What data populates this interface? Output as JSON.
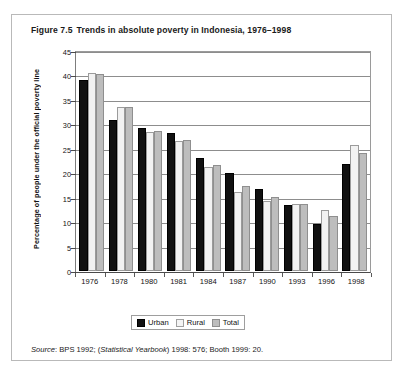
{
  "figure": {
    "number": "Figure 7.5",
    "title": "Trends in absolute poverty in Indonesia, 1976–1998"
  },
  "source_note": {
    "label": "Source",
    "text": ": BPS 1992; (",
    "italic_work": "Statistical Yearbook",
    "text_end": ") 1998: 576; Booth 1999: 20."
  },
  "legend": {
    "position": "bottom-center",
    "items": [
      {
        "label": "Urban",
        "color": "#111111"
      },
      {
        "label": "Rural",
        "color": "#f2f2f2"
      },
      {
        "label": "Total",
        "color": "#bdbdbd"
      }
    ]
  },
  "chart_data": {
    "type": "bar",
    "title": "Trends in absolute poverty in Indonesia, 1976–1998",
    "subtitle": "",
    "xlabel": "",
    "ylabel": "Percentage of people under the official poverty line",
    "categories": [
      "1976",
      "1978",
      "1980",
      "1981",
      "1984",
      "1987",
      "1990",
      "1993",
      "1996",
      "1998"
    ],
    "ylim": [
      0,
      45
    ],
    "yticks": [
      0,
      5,
      10,
      15,
      20,
      25,
      30,
      35,
      40,
      45
    ],
    "ytick_labels": [
      "0",
      "5",
      "10",
      "15",
      "20",
      "25",
      "30",
      "35",
      "40",
      "45"
    ],
    "grid": true,
    "legend_position": "bottom-center",
    "series": [
      {
        "name": "Urban",
        "color": "#111111",
        "values": [
          39.0,
          30.8,
          29.2,
          28.2,
          23.1,
          20.1,
          16.8,
          13.6,
          9.7,
          21.9
        ]
      },
      {
        "name": "Rural",
        "color": "#f2f2f2",
        "values": [
          40.6,
          33.5,
          28.4,
          26.5,
          21.2,
          16.1,
          14.3,
          13.8,
          12.4,
          25.7
        ]
      },
      {
        "name": "Total",
        "color": "#bdbdbd",
        "values": [
          40.2,
          33.5,
          28.6,
          26.9,
          21.6,
          17.4,
          15.1,
          13.7,
          11.3,
          24.2
        ]
      }
    ]
  }
}
